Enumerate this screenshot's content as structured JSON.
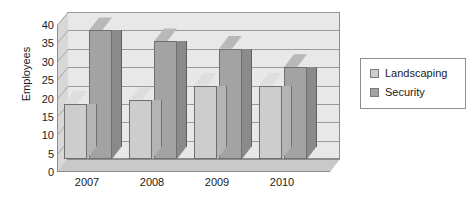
{
  "chart_data": {
    "type": "bar",
    "title": "",
    "xlabel": "",
    "ylabel": "Employees",
    "categories": [
      "2007",
      "2008",
      "2009",
      "2010"
    ],
    "series": [
      {
        "name": "Landscaping",
        "color": "#cdcdcd",
        "values": [
          15,
          16,
          20,
          20
        ]
      },
      {
        "name": "Security",
        "color": "#a3a3a3",
        "values": [
          35,
          32,
          30,
          25
        ]
      }
    ],
    "ylim": [
      0,
      40
    ],
    "ytick_labels": [
      "0",
      "5",
      "10",
      "15",
      "20",
      "25",
      "30",
      "35",
      "40"
    ],
    "ytick_values": [
      0,
      5,
      10,
      15,
      20,
      25,
      30,
      35,
      40
    ],
    "grid": true,
    "legend_position": "right",
    "style": "3d-column"
  },
  "legend": {
    "items": [
      {
        "label": "Landscaping",
        "color": "#cdcdcd"
      },
      {
        "label": "Security",
        "color": "#a3a3a3"
      }
    ]
  },
  "colors": {
    "plot_background": "#e8e8e8",
    "gridline": "#9a9a9a",
    "axis": "#8d8d8d",
    "text": "#1a1a1a",
    "landscaping": "#cdcdcd",
    "security": "#a3a3a3"
  }
}
